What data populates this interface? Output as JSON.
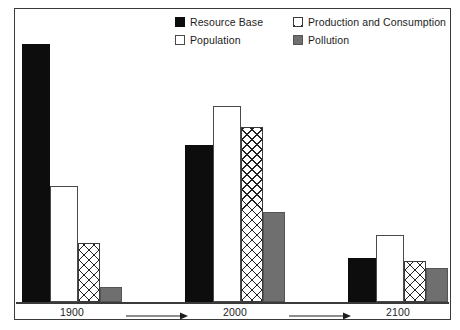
{
  "chart_data": {
    "type": "bar",
    "title": "",
    "subtitle": "",
    "xlabel": "",
    "ylabel": "",
    "grid": false,
    "legend_position": "top-center-right",
    "categories": [
      "1900",
      "2000",
      "2100"
    ],
    "series": [
      {
        "name": "Resource Base",
        "key": "resource-base",
        "pattern": "solid-black",
        "color": "#0d0d0d",
        "values": [
          100,
          61,
          17
        ]
      },
      {
        "name": "Population",
        "key": "population",
        "pattern": "white-outline",
        "color": "#ffffff",
        "values": [
          45,
          76,
          26
        ]
      },
      {
        "name": "Production and Consumption",
        "key": "production-and-consumption",
        "pattern": "crosshatch",
        "color": "#ffffff",
        "values": [
          23,
          68,
          16
        ]
      },
      {
        "name": "Pollution",
        "key": "pollution",
        "pattern": "solid-gray",
        "color": "#6f6f6f",
        "values": [
          6,
          35,
          13
        ]
      }
    ],
    "ylim": [
      0,
      100
    ],
    "axis_baseline_visible": true,
    "annotations": [
      {
        "type": "arrow",
        "label": "",
        "between": [
          "1900",
          "2000"
        ]
      },
      {
        "type": "arrow",
        "label": "",
        "between": [
          "2000",
          "2100"
        ]
      }
    ]
  },
  "legend": {
    "items": [
      {
        "label": "Resource Base",
        "swatch": "solid-black-swatch"
      },
      {
        "label": "Production and Consumption",
        "swatch": "crosshatch-swatch"
      },
      {
        "label": "Population",
        "swatch": "white-outline-swatch"
      },
      {
        "label": "Pollution",
        "swatch": "solid-gray-swatch"
      }
    ]
  },
  "axis": {
    "ticks": [
      "1900",
      "2000",
      "2100"
    ]
  },
  "colors": {
    "frame": "#3a3a3a",
    "black_bar": "#0d0d0d",
    "gray_bar": "#6f6f6f",
    "white_bar": "#ffffff",
    "hatch_line": "#222222",
    "text": "#1c1c1c"
  }
}
